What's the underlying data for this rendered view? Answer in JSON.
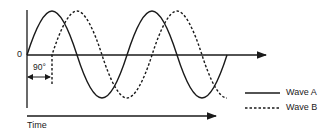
{
  "diagram": {
    "zero_label": "0",
    "phase_label": "90°",
    "time_label": "Time",
    "legend": [
      {
        "label": "Wave A",
        "style": "solid"
      },
      {
        "label": "Wave B",
        "style": "dashed"
      }
    ],
    "phase_shift_degrees": 90,
    "colors": {
      "line": "#1a1a1a",
      "background": "#ffffff"
    }
  }
}
